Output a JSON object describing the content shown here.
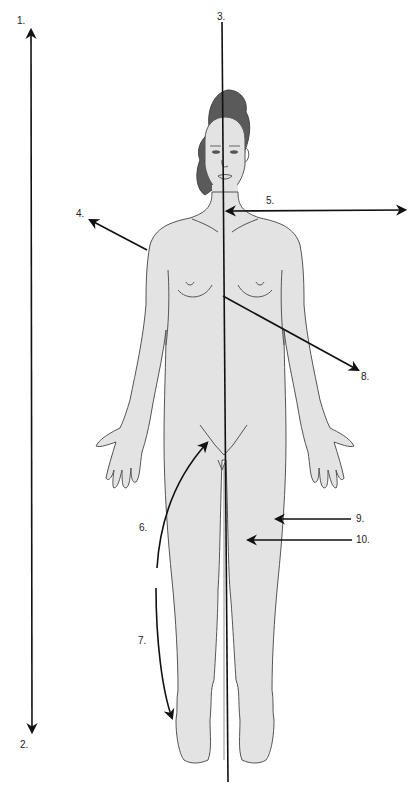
{
  "figure": {
    "type": "anatomical-planes-and-directions-diagram",
    "colors": {
      "body_fill": "#e3e3e3",
      "outline": "#555555",
      "hair": "#5a5a5a",
      "arrow": "#111111",
      "background": "#ffffff"
    },
    "labels": [
      {
        "id": "1",
        "text": "1.",
        "target": "top of long vertical arrow (superior)"
      },
      {
        "id": "2",
        "text": "2.",
        "target": "bottom of long vertical arrow (inferior)"
      },
      {
        "id": "3",
        "text": "3.",
        "target": "vertical midline plane through body"
      },
      {
        "id": "4",
        "text": "4.",
        "target": "arrow from shoulder pointing up-left"
      },
      {
        "id": "5",
        "text": "5.",
        "target": "horizontal double arrow from midline at neck to right"
      },
      {
        "id": "6",
        "text": "6.",
        "target": "curved arrow pointing up to hip/groin"
      },
      {
        "id": "7",
        "text": "7.",
        "target": "curved arrow pointing down to foot"
      },
      {
        "id": "8",
        "text": "8.",
        "target": "arrow from midline chest pointing down-right"
      },
      {
        "id": "9",
        "text": "9.",
        "target": "arrow pointing to outer (lateral) thigh"
      },
      {
        "id": "10",
        "text": "10.",
        "target": "arrow pointing to inner part of thigh"
      }
    ]
  }
}
